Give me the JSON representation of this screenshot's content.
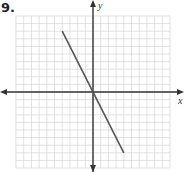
{
  "problem": {
    "number_label": "9."
  },
  "chart_data": {
    "type": "line",
    "title": "",
    "xlabel": "x",
    "ylabel": "y",
    "xlim": [
      -10,
      10
    ],
    "ylim": [
      -10,
      10
    ],
    "grid": true,
    "grid_step": 1,
    "series": [
      {
        "name": "y = -2x",
        "x": [
          -4,
          4
        ],
        "y": [
          8,
          -8
        ]
      }
    ],
    "colors": {
      "grid": "#d4d4d4",
      "axes": "#333333",
      "line": "#555555"
    }
  }
}
